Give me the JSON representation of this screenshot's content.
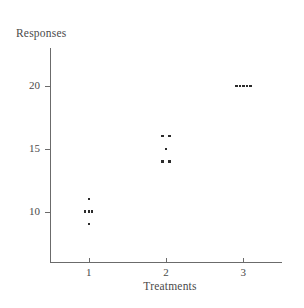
{
  "chart_data": {
    "type": "scatter",
    "title": "",
    "xlabel": "Treatments",
    "ylabel": "Responses",
    "xlim": [
      0.5,
      3.5
    ],
    "ylim": [
      6,
      23
    ],
    "grid": false,
    "legend": null,
    "xticks": [
      "1",
      "2",
      "3"
    ],
    "xtick_values": [
      1,
      2,
      3
    ],
    "yticks": [
      "10",
      "15",
      "20"
    ],
    "ytick_values": [
      10,
      15,
      20
    ],
    "series": [
      {
        "name": "Treatment 1",
        "x": [
          1,
          0.955,
          1,
          1.045,
          1
        ],
        "y": [
          11,
          10,
          10,
          10,
          9
        ],
        "values": [
          11,
          10,
          10,
          10,
          9
        ]
      },
      {
        "name": "Treatment 2",
        "x": [
          1.955,
          2.045,
          2,
          1.955,
          2.045
        ],
        "y": [
          16,
          16,
          15,
          14,
          14
        ],
        "values": [
          16,
          16,
          15,
          14,
          14
        ]
      },
      {
        "name": "Treatment 3",
        "x": [
          2.91,
          2.955,
          3,
          3.045,
          3.09
        ],
        "y": [
          20,
          20,
          20,
          20,
          20
        ],
        "values": [
          20,
          20,
          20,
          20,
          20
        ]
      }
    ],
    "points": [
      {
        "x": 1,
        "y": 11
      },
      {
        "x": 0.955,
        "y": 10
      },
      {
        "x": 1,
        "y": 10
      },
      {
        "x": 1.045,
        "y": 10
      },
      {
        "x": 1,
        "y": 9
      },
      {
        "x": 1.955,
        "y": 16
      },
      {
        "x": 2.045,
        "y": 16
      },
      {
        "x": 2,
        "y": 15
      },
      {
        "x": 1.955,
        "y": 14
      },
      {
        "x": 2.045,
        "y": 14
      },
      {
        "x": 2.91,
        "y": 20
      },
      {
        "x": 2.955,
        "y": 20
      },
      {
        "x": 3,
        "y": 20
      },
      {
        "x": 3.045,
        "y": 20
      },
      {
        "x": 3.09,
        "y": 20
      }
    ],
    "marker_color": "#2b2b2b",
    "axis_color": "#6b6b6b"
  },
  "labels": {
    "y_axis_title": "Responses",
    "x_axis_title": "Treatments",
    "y_ticks": [
      "20",
      "15",
      "10"
    ],
    "x_ticks": [
      "1",
      "2",
      "3"
    ]
  }
}
